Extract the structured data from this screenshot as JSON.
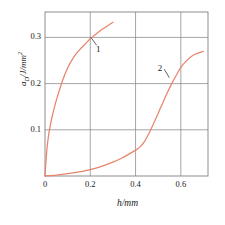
{
  "chart_data": {
    "type": "line",
    "title": "",
    "subtitle": "",
    "xlabel": "h/mm",
    "xlabel_italic_symbol": "h",
    "xlabel_unit": "/mm",
    "ylabel": "a_D/J/mm^2",
    "ylabel_symbol": "a",
    "ylabel_subscript": "D",
    "ylabel_unit": "/J/mm",
    "ylabel_unit_exponent": "2",
    "xlim": [
      0,
      0.72
    ],
    "ylim": [
      0,
      0.355
    ],
    "xticks": [
      0,
      0.2,
      0.4,
      0.6
    ],
    "xticklabels": [
      "0",
      "0.2",
      "0.4",
      "0.6"
    ],
    "yticks": [
      0.1,
      0.2,
      0.3
    ],
    "yticklabels": [
      "0.1",
      "0.2",
      "0.3"
    ],
    "grid": true,
    "grid_color": "#808080",
    "frame_color": "#808080",
    "legend": "none",
    "curve_color": "#e8846b",
    "annotation_color": "#3c3c3c",
    "series": [
      {
        "name": "1",
        "label": "1",
        "x": [
          0.0,
          0.004,
          0.01,
          0.018,
          0.03,
          0.045,
          0.06,
          0.08,
          0.1,
          0.12,
          0.14,
          0.16,
          0.18,
          0.2,
          0.22,
          0.245,
          0.27,
          0.3
        ],
        "y": [
          0.0,
          0.03,
          0.065,
          0.095,
          0.125,
          0.155,
          0.18,
          0.21,
          0.234,
          0.252,
          0.266,
          0.277,
          0.287,
          0.297,
          0.305,
          0.315,
          0.323,
          0.333
        ]
      },
      {
        "name": "2",
        "label": "2",
        "x": [
          0.0,
          0.05,
          0.1,
          0.15,
          0.2,
          0.25,
          0.3,
          0.34,
          0.38,
          0.4,
          0.42,
          0.44,
          0.46,
          0.48,
          0.5,
          0.52,
          0.54,
          0.56,
          0.58,
          0.6,
          0.63,
          0.66,
          0.7
        ],
        "y": [
          0.0,
          0.002,
          0.005,
          0.009,
          0.014,
          0.021,
          0.03,
          0.039,
          0.05,
          0.056,
          0.063,
          0.075,
          0.093,
          0.114,
          0.136,
          0.158,
          0.18,
          0.2,
          0.218,
          0.235,
          0.252,
          0.263,
          0.27
        ]
      }
    ],
    "annotations": [
      {
        "text": "1",
        "label_x": 0.235,
        "label_y": 0.272,
        "leader_from_x": 0.228,
        "leader_from_y": 0.283,
        "leader_to_x": 0.203,
        "leader_to_y": 0.3
      },
      {
        "text": "2",
        "label_x": 0.508,
        "label_y": 0.232,
        "leader_from_x": 0.527,
        "leader_from_y": 0.231,
        "leader_to_x": 0.549,
        "leader_to_y": 0.213
      }
    ]
  }
}
